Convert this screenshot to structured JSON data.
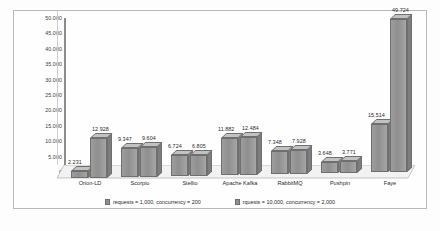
{
  "chart_data": {
    "type": "bar",
    "title": "",
    "subtitle": "",
    "xlabel": "",
    "ylabel": "",
    "ylim": [
      0,
      50000
    ],
    "grid": false,
    "legend_position": "bottom",
    "categories": [
      "Orion-LD",
      "Scorpio",
      "Stellio",
      "Apache Kafka",
      "RabbitMQ",
      "Pushpin",
      "Faye"
    ],
    "ytick_labels": [
      "50.000",
      "45.000",
      "40.000",
      "35.000",
      "30.000",
      "25.000",
      "20.000",
      "15.000",
      "10.000",
      "5.000",
      "0"
    ],
    "ytick_values": [
      50000,
      45000,
      40000,
      35000,
      30000,
      25000,
      20000,
      15000,
      10000,
      5000,
      0
    ],
    "series": [
      {
        "name": "requests = 1,000, concurrency = 200",
        "color": "#8f8f8f",
        "values": [
          2231,
          9347,
          6724,
          11882,
          7348,
          3648,
          15514
        ],
        "labels": [
          "2.231",
          "9.347",
          "6.724",
          "11.882",
          "7.348",
          "3.648",
          "15.514"
        ]
      },
      {
        "name": "rquests = 10,000, concurrency = 2,000",
        "color": "#8f8f8f",
        "values": [
          12928,
          9604,
          6805,
          12484,
          7928,
          3771,
          49724
        ],
        "labels": [
          "12.928",
          "9.604",
          "6.805",
          "12.484",
          "7.928",
          "3.771",
          "49.724"
        ]
      }
    ]
  },
  "legend": {
    "items": [
      {
        "label": "requests = 1,000, concurrency = 200"
      },
      {
        "label": "rquests = 10,000, concurrency = 2,000"
      }
    ]
  }
}
